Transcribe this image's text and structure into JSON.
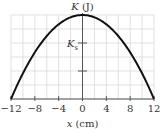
{
  "chart_data": {
    "type": "line",
    "title": "",
    "xlabel": "x (cm)",
    "ylabel": "K (J)",
    "xlim": [
      -12,
      12
    ],
    "ylim": [
      0,
      1
    ],
    "x_ticks": [
      -12,
      -8,
      -4,
      0,
      4,
      8,
      12
    ],
    "x_tick_labels": [
      "-12",
      "-8",
      "-4",
      "0",
      "4",
      "8",
      "12"
    ],
    "y_ticks_fraction_of_max": [
      0.333,
      0.667
    ],
    "y_tick_labels": [
      "",
      "K_s"
    ],
    "grid": true,
    "grid_x_step_cm": 2,
    "grid_y_divisions": 6,
    "series": [
      {
        "name": "K(x)",
        "shape": "downward parabola, max at x=0, zero at x=±12",
        "x": [
          -12,
          -10,
          -8,
          -6,
          -4,
          -2,
          0,
          2,
          4,
          6,
          8,
          10,
          12
        ],
        "values": [
          0,
          0.306,
          0.556,
          0.75,
          0.889,
          0.972,
          1.0,
          0.972,
          0.889,
          0.75,
          0.556,
          0.306,
          0
        ]
      }
    ],
    "annotations": [
      {
        "text": "K_s",
        "at_y_fraction": 0.667,
        "position": "left of y-axis"
      }
    ]
  },
  "labels": {
    "y_axis_main": "K",
    "y_axis_unit": " (J)",
    "x_axis_main": "x",
    "x_axis_unit": " (cm)",
    "ks_main": "K",
    "ks_sub": "s",
    "x_ticks": [
      "-12",
      "-8",
      "-4",
      "0",
      "4",
      "8",
      "12"
    ]
  }
}
